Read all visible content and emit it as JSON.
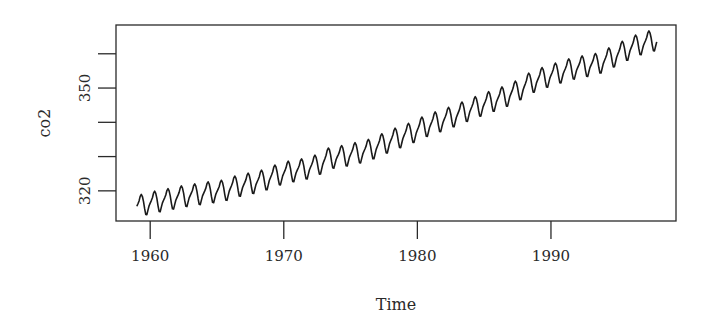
{
  "chart_data": {
    "type": "line",
    "title": "",
    "xlabel": "Time",
    "ylabel": "co2",
    "xlim": [
      1957.44,
      1999.36
    ],
    "ylim": [
      311.2,
      368.4
    ],
    "x_ticks": [
      1960,
      1970,
      1980,
      1990
    ],
    "x_tick_labels": [
      "1960",
      "1970",
      "1980",
      "1990"
    ],
    "y_ticks": [
      320,
      330,
      340,
      350,
      360
    ],
    "y_tick_labels": [
      "320",
      "",
      "",
      "350",
      ""
    ],
    "grid": false,
    "legend": null,
    "series": [
      {
        "name": "co2",
        "frequency": "monthly",
        "start": 1959.0,
        "end": 1997.917,
        "annual_mean": {
          "years": [
            1959,
            1960,
            1961,
            1962,
            1963,
            1964,
            1965,
            1966,
            1967,
            1968,
            1969,
            1970,
            1971,
            1972,
            1973,
            1974,
            1975,
            1976,
            1977,
            1978,
            1979,
            1980,
            1981,
            1982,
            1983,
            1984,
            1985,
            1986,
            1987,
            1988,
            1989,
            1990,
            1991,
            1992,
            1993,
            1994,
            1995,
            1996,
            1997
          ],
          "values": [
            315.98,
            316.91,
            317.64,
            318.45,
            318.99,
            319.62,
            320.04,
            321.38,
            322.16,
            323.04,
            324.62,
            325.68,
            326.32,
            327.45,
            329.68,
            330.17,
            331.08,
            332.05,
            333.78,
            335.41,
            336.78,
            338.68,
            340.1,
            341.44,
            343.03,
            344.58,
            346.04,
            347.39,
            349.16,
            351.56,
            353.07,
            354.35,
            355.57,
            356.38,
            357.07,
            358.82,
            360.8,
            362.59,
            363.71
          ]
        },
        "seasonal_offsets": [
          -0.05,
          0.6,
          1.35,
          2.6,
          3.1,
          2.4,
          0.85,
          -1.3,
          -3.05,
          -3.2,
          -1.95,
          -0.75
        ]
      }
    ],
    "color": "#1a1a1a"
  }
}
